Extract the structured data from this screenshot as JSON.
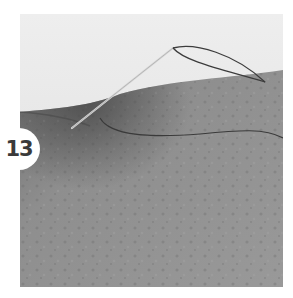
{
  "figure": {
    "step_number": "13",
    "scene": "needle-and-thread-stitching-fabric",
    "colors": {
      "background": "#ffffff",
      "backdrop": "#e9e9e9",
      "fabric": "#8c8c8c",
      "fabric_dark": "#5e5e5e",
      "thread": "#3c3c3c",
      "needle": "#d6d6d6",
      "badge_bg": "#ffffff",
      "badge_text": "#3a3a3a"
    }
  }
}
